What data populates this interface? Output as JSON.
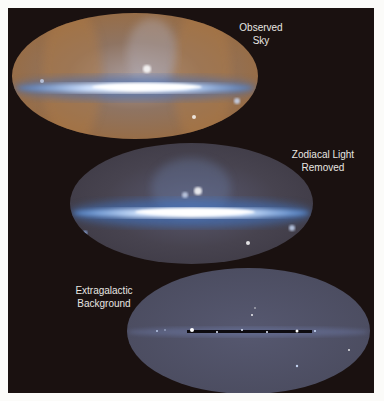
{
  "figure": {
    "panels": [
      {
        "id": "observed",
        "label_lines": [
          "Observed",
          "Sky"
        ],
        "description": "All-sky infrared map with zodiacal light (orange) and bright galactic plane (blue-white)",
        "colors": {
          "base": "#8a6a4a",
          "glow": "#c08a55",
          "band": "#eaf3ff",
          "band_edge": "#5f8fd0"
        }
      },
      {
        "id": "zodiacal-removed",
        "label_lines": [
          "Zodiacal Light",
          "Removed"
        ],
        "description": "All-sky map after zodiacal light subtraction; galactic plane in blue-white",
        "colors": {
          "base": "#4a4555",
          "glow": "#5a6a8a",
          "band": "#f2f8ff",
          "band_edge": "#4f86d0"
        }
      },
      {
        "id": "extragalactic",
        "label_lines": [
          "Extragalactic",
          "Background"
        ],
        "description": "Residual extragalactic background; uniform gray-blue with dark masked plane",
        "colors": {
          "base": "#4e4f62",
          "glow": "#55576c",
          "band": "#0d0b10",
          "band_edge": "#c8d8ff"
        }
      }
    ]
  }
}
